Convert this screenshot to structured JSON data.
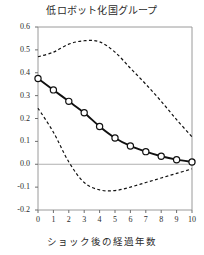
{
  "chart_data": {
    "type": "line",
    "title": "低ロボット化国グループ",
    "xlabel": "ショック後の経過年数",
    "ylabel": "",
    "xlim": [
      0,
      10
    ],
    "ylim": [
      -0.2,
      0.6
    ],
    "grid": false,
    "legend": null,
    "zero_line": 0.0,
    "x": [
      0,
      1,
      2,
      3,
      4,
      5,
      6,
      7,
      8,
      9,
      10
    ],
    "xticklabels": [
      "0",
      "1",
      "2",
      "3",
      "4",
      "5",
      "6",
      "7",
      "8",
      "9",
      "10"
    ],
    "yticklabels": [
      "0.6",
      "0.5",
      "0.4",
      "0.3",
      "0.2",
      "0.1",
      "0.0",
      "-0.1",
      "-0.2"
    ],
    "ytickvalues": [
      0.6,
      0.5,
      0.4,
      0.3,
      0.2,
      0.1,
      0.0,
      -0.1,
      -0.2
    ],
    "series": [
      {
        "name": "point-estimate",
        "style": "solid",
        "marker": "circle",
        "color": "#111111",
        "values": [
          0.375,
          0.325,
          0.275,
          0.225,
          0.165,
          0.115,
          0.08,
          0.055,
          0.035,
          0.02,
          0.01
        ]
      },
      {
        "name": "upper-confidence-band",
        "style": "dashed",
        "marker": "none",
        "color": "#111111",
        "values": [
          0.47,
          0.49,
          0.525,
          0.54,
          0.535,
          0.49,
          0.42,
          0.35,
          0.275,
          0.195,
          0.12
        ]
      },
      {
        "name": "lower-confidence-band",
        "style": "dashed",
        "marker": "none",
        "color": "#111111",
        "values": [
          0.245,
          0.14,
          0.01,
          -0.08,
          -0.112,
          -0.115,
          -0.1,
          -0.08,
          -0.06,
          -0.04,
          -0.02
        ]
      }
    ]
  }
}
